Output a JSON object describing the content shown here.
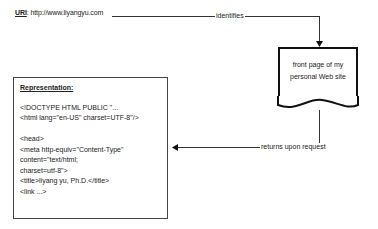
{
  "uri": {
    "label": "URI",
    "value": ": http://www.liyangyu.com"
  },
  "edges": {
    "identifies": "identifies",
    "returns": "returns upon request"
  },
  "resource": {
    "line1": "front page of my",
    "line2": "personal Web site"
  },
  "representation": {
    "title": "Representation:",
    "lines": [
      "<!DOCTYPE HTML PUBLIC \"...",
      "<html lang=\"en-US\" charset=UTF-8\"/>",
      "",
      "<head>",
      "<meta http-equiv=\"Content-Type\" content=\"text/html;",
      "charset=utf-8\">",
      "<title>liyang yu, Ph.D.</title>",
      "<link ...>"
    ]
  }
}
